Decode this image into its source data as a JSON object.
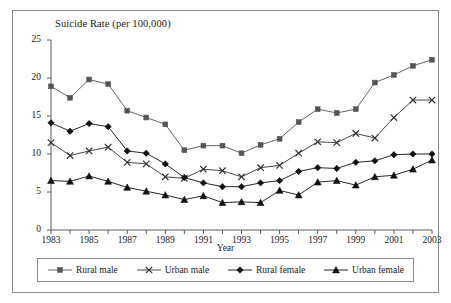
{
  "figure": {
    "title": "Suicide Rate (per 100,000)",
    "x_axis_title": "Year"
  },
  "chart_data": {
    "type": "line",
    "title": "Suicide Rate (per 100,000)",
    "xlabel": "Year",
    "ylabel": "Suicide Rate (per 100,000)",
    "xlim": [
      1983,
      2003
    ],
    "ylim": [
      0,
      25
    ],
    "y_ticks": [
      "0",
      "5",
      "10",
      "15",
      "20",
      "25"
    ],
    "y_tick_values": [
      0,
      5,
      10,
      15,
      20,
      25
    ],
    "x_ticks": [
      "1983",
      "1985",
      "1987",
      "1989",
      "1991",
      "1993",
      "1995",
      "1997",
      "1999",
      "2001",
      "2003"
    ],
    "x_tick_values": [
      1983,
      1985,
      1987,
      1989,
      1991,
      1993,
      1995,
      1997,
      1999,
      2001,
      2003
    ],
    "x_minor_tick_interval": 1,
    "grid": false,
    "legend_position": "bottom",
    "x": [
      1983,
      1984,
      1985,
      1986,
      1987,
      1988,
      1989,
      1990,
      1991,
      1992,
      1993,
      1994,
      1995,
      1996,
      1997,
      1998,
      1999,
      2000,
      2001,
      2002,
      2003
    ],
    "series": [
      {
        "name": "Rural male",
        "marker": "square",
        "color": "#555555",
        "values": [
          18.9,
          17.4,
          19.8,
          19.2,
          15.7,
          14.8,
          13.9,
          10.5,
          11.1,
          11.1,
          10.1,
          11.2,
          12.0,
          14.2,
          15.9,
          15.4,
          15.9,
          19.4,
          20.4,
          21.6,
          22.4
        ]
      },
      {
        "name": "Urban male",
        "marker": "cross",
        "color": "#333333",
        "values": [
          11.5,
          9.8,
          10.4,
          10.9,
          8.9,
          8.7,
          7.0,
          6.8,
          8.0,
          7.8,
          7.0,
          8.2,
          8.5,
          10.1,
          11.6,
          11.5,
          12.7,
          12.1,
          14.8,
          17.1,
          17.1
        ]
      },
      {
        "name": "Rural female",
        "marker": "diamond",
        "color": "#111111",
        "values": [
          14.1,
          13.0,
          14.0,
          13.6,
          10.4,
          10.1,
          8.7,
          6.9,
          6.2,
          5.7,
          5.7,
          6.2,
          6.5,
          7.7,
          8.2,
          8.1,
          8.9,
          9.1,
          9.9,
          10.0,
          10.0
        ]
      },
      {
        "name": "Urban female",
        "marker": "triangle",
        "color": "#111111",
        "values": [
          6.5,
          6.4,
          7.1,
          6.4,
          5.6,
          5.1,
          4.6,
          4.0,
          4.5,
          3.6,
          3.7,
          3.6,
          5.2,
          4.6,
          6.3,
          6.5,
          5.9,
          7.0,
          7.2,
          8.0,
          9.2
        ]
      }
    ]
  },
  "legend": {
    "items": [
      {
        "label": "Rural male",
        "marker": "square"
      },
      {
        "label": "Urban male",
        "marker": "cross"
      },
      {
        "label": "Rural female",
        "marker": "diamond"
      },
      {
        "label": "Urban female",
        "marker": "triangle"
      }
    ]
  }
}
